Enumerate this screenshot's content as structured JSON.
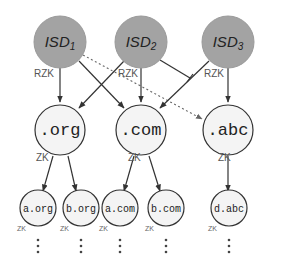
{
  "diagram": {
    "isds": [
      {
        "id": "isd1",
        "label": "ISD",
        "sub": "1"
      },
      {
        "id": "isd2",
        "label": "ISD",
        "sub": "2"
      },
      {
        "id": "isd3",
        "label": "ISD",
        "sub": "3"
      }
    ],
    "tlds": [
      {
        "id": "org",
        "label": ".org"
      },
      {
        "id": "com",
        "label": ".com"
      },
      {
        "id": "abc",
        "label": ".abc"
      }
    ],
    "leaves": [
      {
        "id": "a-org",
        "label": "a.org"
      },
      {
        "id": "b-org",
        "label": "b.org"
      },
      {
        "id": "a-com",
        "label": "a.com"
      },
      {
        "id": "b-com",
        "label": "b.com"
      },
      {
        "id": "d-abc",
        "label": "d.abc"
      }
    ],
    "edge_labels": {
      "rzk": "RZK",
      "zk": "ZK"
    },
    "edges": [
      {
        "from": "isd1",
        "to": "org",
        "style": "solid-arrow"
      },
      {
        "from": "isd1",
        "to": "com",
        "style": "solid-arrow"
      },
      {
        "from": "isd1",
        "to": "abc",
        "style": "dashed-arrow"
      },
      {
        "from": "isd2",
        "to": "org",
        "style": "solid-arrow"
      },
      {
        "from": "isd2",
        "to": "com",
        "style": "solid-arrow"
      },
      {
        "from": "isd2",
        "to": "blocked",
        "style": "solid-bar"
      },
      {
        "from": "isd3",
        "to": "com",
        "style": "solid-arrow"
      },
      {
        "from": "isd3",
        "to": "abc",
        "style": "solid-arrow"
      },
      {
        "from": "org",
        "to": "a-org",
        "style": "solid-arrow"
      },
      {
        "from": "org",
        "to": "b-org",
        "style": "solid-arrow"
      },
      {
        "from": "com",
        "to": "a-com",
        "style": "solid-arrow"
      },
      {
        "from": "com",
        "to": "b-com",
        "style": "solid-arrow"
      },
      {
        "from": "abc",
        "to": "d-abc",
        "style": "solid-arrow"
      }
    ],
    "colors": {
      "isd_fill": "#a3a3a3",
      "node_fill": "#f4f4f4",
      "stroke": "#333333"
    }
  }
}
